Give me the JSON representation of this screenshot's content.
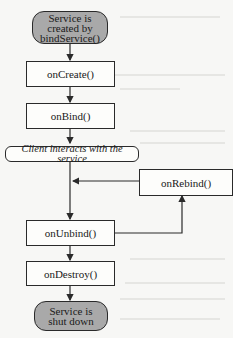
{
  "diagram": {
    "nodes": [
      {
        "id": "start",
        "label": "Service is created by bindService()",
        "line1": "Service is",
        "line2": "created by",
        "line3": "bindService()",
        "type": "terminal"
      },
      {
        "id": "onCreate",
        "label": "onCreate()",
        "type": "process"
      },
      {
        "id": "onBind",
        "label": "onBind()",
        "type": "process"
      },
      {
        "id": "interact",
        "label": "Client interacts with the service",
        "type": "state"
      },
      {
        "id": "onRebind",
        "label": "onRebind()",
        "type": "process"
      },
      {
        "id": "onUnbind",
        "label": "onUnbind()",
        "type": "process"
      },
      {
        "id": "onDestroy",
        "label": "onDestroy()",
        "type": "process"
      },
      {
        "id": "end",
        "label": "Service is shut down",
        "line1": "Service is",
        "line2": "shut down",
        "type": "terminal"
      }
    ],
    "edges": [
      {
        "from": "start",
        "to": "onCreate"
      },
      {
        "from": "onCreate",
        "to": "onBind"
      },
      {
        "from": "onBind",
        "to": "interact"
      },
      {
        "from": "interact",
        "to": "onUnbind"
      },
      {
        "from": "onUnbind",
        "to": "onRebind"
      },
      {
        "from": "onRebind",
        "to": "interact-path"
      },
      {
        "from": "onUnbind",
        "to": "onDestroy"
      },
      {
        "from": "onDestroy",
        "to": "end"
      }
    ],
    "colors": {
      "terminal_fill": "#a9a9a9",
      "stroke": "#2a2a2a",
      "background": "#f7f7f5"
    }
  }
}
